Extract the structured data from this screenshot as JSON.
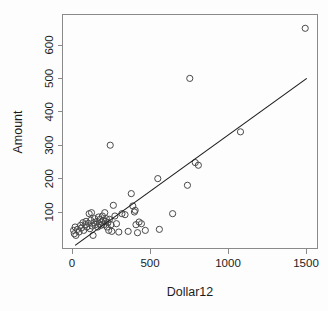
{
  "chart_data": {
    "type": "scatter",
    "title": "",
    "xlabel": "Dollar12",
    "ylabel": "Amount",
    "xlim": [
      -40,
      1570
    ],
    "ylim": [
      10,
      700
    ],
    "grid": false,
    "legend": null,
    "xticks": [
      0,
      500,
      1000,
      1500
    ],
    "xtick_labels": [
      "0",
      "500",
      "1000",
      "1500"
    ],
    "yticks": [
      100,
      200,
      300,
      400,
      500,
      600
    ],
    "ytick_labels": [
      "100",
      "200",
      "300",
      "400",
      "500",
      "600"
    ],
    "point_marker": "open-circle",
    "point_color": "#4a4a4a",
    "line_color": "#1c1c1c",
    "background_color": "#fdfdfd",
    "fit_line": {
      "type": "linear-regression",
      "x_start": 20,
      "y_start": 0,
      "x_end": 1505,
      "y_end": 500,
      "slope": 0.3367,
      "intercept": -6.7
    },
    "points": [
      {
        "x": 10,
        "y": 45
      },
      {
        "x": 15,
        "y": 35
      },
      {
        "x": 20,
        "y": 55
      },
      {
        "x": 25,
        "y": 30
      },
      {
        "x": 35,
        "y": 48
      },
      {
        "x": 45,
        "y": 40
      },
      {
        "x": 55,
        "y": 60
      },
      {
        "x": 60,
        "y": 52
      },
      {
        "x": 70,
        "y": 68
      },
      {
        "x": 75,
        "y": 45
      },
      {
        "x": 85,
        "y": 62
      },
      {
        "x": 90,
        "y": 72
      },
      {
        "x": 95,
        "y": 55
      },
      {
        "x": 105,
        "y": 66
      },
      {
        "x": 110,
        "y": 95
      },
      {
        "x": 115,
        "y": 50
      },
      {
        "x": 120,
        "y": 75
      },
      {
        "x": 125,
        "y": 98
      },
      {
        "x": 130,
        "y": 58
      },
      {
        "x": 135,
        "y": 30
      },
      {
        "x": 140,
        "y": 68
      },
      {
        "x": 145,
        "y": 80
      },
      {
        "x": 150,
        "y": 62
      },
      {
        "x": 160,
        "y": 72
      },
      {
        "x": 165,
        "y": 55
      },
      {
        "x": 170,
        "y": 85
      },
      {
        "x": 175,
        "y": 65
      },
      {
        "x": 180,
        "y": 78
      },
      {
        "x": 185,
        "y": 60
      },
      {
        "x": 190,
        "y": 70
      },
      {
        "x": 195,
        "y": 88
      },
      {
        "x": 200,
        "y": 75
      },
      {
        "x": 205,
        "y": 62
      },
      {
        "x": 210,
        "y": 98
      },
      {
        "x": 215,
        "y": 72
      },
      {
        "x": 220,
        "y": 80
      },
      {
        "x": 225,
        "y": 55
      },
      {
        "x": 230,
        "y": 68
      },
      {
        "x": 235,
        "y": 45
      },
      {
        "x": 240,
        "y": 78
      },
      {
        "x": 245,
        "y": 300
      },
      {
        "x": 250,
        "y": 62
      },
      {
        "x": 255,
        "y": 42
      },
      {
        "x": 265,
        "y": 120
      },
      {
        "x": 275,
        "y": 88
      },
      {
        "x": 285,
        "y": 65
      },
      {
        "x": 300,
        "y": 40
      },
      {
        "x": 320,
        "y": 95
      },
      {
        "x": 340,
        "y": 92
      },
      {
        "x": 360,
        "y": 42
      },
      {
        "x": 380,
        "y": 155
      },
      {
        "x": 390,
        "y": 118
      },
      {
        "x": 400,
        "y": 100
      },
      {
        "x": 405,
        "y": 105
      },
      {
        "x": 410,
        "y": 62
      },
      {
        "x": 420,
        "y": 38
      },
      {
        "x": 430,
        "y": 70
      },
      {
        "x": 445,
        "y": 65
      },
      {
        "x": 470,
        "y": 45
      },
      {
        "x": 550,
        "y": 200
      },
      {
        "x": 560,
        "y": 48
      },
      {
        "x": 645,
        "y": 95
      },
      {
        "x": 740,
        "y": 180
      },
      {
        "x": 755,
        "y": 500
      },
      {
        "x": 790,
        "y": 248
      },
      {
        "x": 810,
        "y": 240
      },
      {
        "x": 1080,
        "y": 340
      },
      {
        "x": 1495,
        "y": 650
      }
    ]
  },
  "axes": {
    "x_title": "Dollar12",
    "y_title": "Amount"
  }
}
